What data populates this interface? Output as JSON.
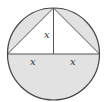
{
  "diagram": {
    "type": "geometry",
    "labels": {
      "height": "x",
      "left_half_base": "x",
      "right_half_base": "x"
    },
    "colors": {
      "shade": "#e2e2e2",
      "stroke": "#444444",
      "background": "#ffffff"
    }
  }
}
